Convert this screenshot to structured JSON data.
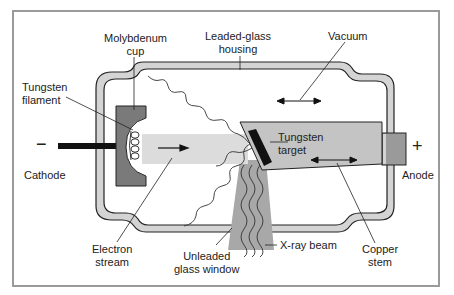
{
  "diagram": {
    "labels": {
      "molybdenum_cup": [
        "Molybdenum",
        "cup"
      ],
      "leaded_glass": [
        "Leaded-glass",
        "housing"
      ],
      "vacuum": "Vacuum",
      "tungsten_filament": [
        "Tungsten",
        "filament"
      ],
      "tungsten_target": [
        "Tungsten",
        "target"
      ],
      "cathode": "Cathode",
      "anode": "Anode",
      "electron_stream": [
        "Electron",
        "stream"
      ],
      "unleaded_window": [
        "Unleaded",
        "glass window"
      ],
      "xray_beam": "X-ray beam",
      "copper_stem": [
        "Copper",
        "stem"
      ],
      "minus": "−",
      "plus": "+"
    },
    "colors": {
      "glass": "#d4d4d4",
      "cup": "#7a7a7a",
      "stream": "#dcdcdc",
      "target_body": "#c4c4c4",
      "stem": "#9a9a9a",
      "beam": "#a8a8a8",
      "outline": "#222222"
    }
  }
}
